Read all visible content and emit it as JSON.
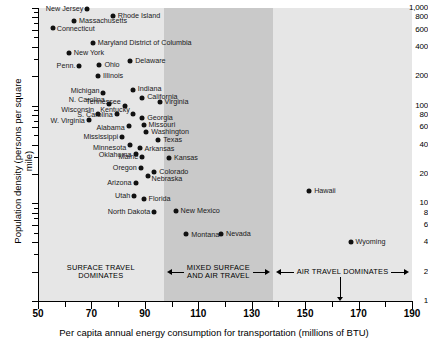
{
  "chart_data": {
    "type": "scatter",
    "title": "",
    "xlabel": "Per capita annual energy consumption for transportation (millions of BTU)",
    "ylabel": "Population density (persons per square mile)",
    "xscale": "linear",
    "yscale": "log",
    "xlim": [
      50,
      190
    ],
    "ylim": [
      1,
      1000
    ],
    "grid": false,
    "legend": "none",
    "xticks": [
      50,
      70,
      90,
      110,
      130,
      150,
      170,
      190
    ],
    "xticklabels": [
      "50",
      "70",
      "90",
      "110",
      "130",
      "150",
      "170",
      "190"
    ],
    "xminorticks": [
      60,
      80,
      100,
      120,
      140,
      160,
      180
    ],
    "yticks": [
      1,
      2,
      4,
      6,
      8,
      10,
      20,
      40,
      60,
      80,
      100,
      200,
      400,
      600,
      800,
      1000
    ],
    "yticklabels": [
      "1",
      "2",
      "4",
      "6",
      "8",
      "10",
      "20",
      "40",
      "60",
      "80",
      "100",
      "200",
      "400",
      "600",
      "800",
      "1,000"
    ],
    "points": [
      {
        "label": "New Jersey",
        "x": 68.5,
        "y": 980,
        "lpos": "l",
        "ldx": -4,
        "ldy": 0
      },
      {
        "label": "Rhode Island",
        "x": 78.0,
        "y": 830,
        "lpos": "r",
        "ldx": 5,
        "ldy": 0
      },
      {
        "label": "Massachusetts",
        "x": 63.5,
        "y": 730,
        "lpos": "r",
        "ldx": 5,
        "ldy": 0
      },
      {
        "label": "Connecticut",
        "x": 55.5,
        "y": 620,
        "lpos": "r",
        "ldx": 4,
        "ldy": 1
      },
      {
        "label": "Maryland District of Columbia",
        "x": 70.5,
        "y": 440,
        "lpos": "r",
        "ldx": 5,
        "ldy": 0
      },
      {
        "label": "New York",
        "x": 61.5,
        "y": 350,
        "lpos": "r",
        "ldx": 5,
        "ldy": 0
      },
      {
        "label": "Delaware",
        "x": 84.5,
        "y": 285,
        "lpos": "r",
        "ldx": 5,
        "ldy": 0
      },
      {
        "label": "Ohio",
        "x": 73.0,
        "y": 260,
        "lpos": "r",
        "ldx": 5,
        "ldy": 0
      },
      {
        "label": "Penn.",
        "x": 65.5,
        "y": 255,
        "lpos": "l",
        "ldx": -4,
        "ldy": 0
      },
      {
        "label": "Illinois",
        "x": 72.5,
        "y": 200,
        "lpos": "r",
        "ldx": 5,
        "ldy": 0
      },
      {
        "label": "Indiana",
        "x": 85.5,
        "y": 145,
        "lpos": "r",
        "ldx": 5,
        "ldy": -1
      },
      {
        "label": "Michigan",
        "x": 74.5,
        "y": 135,
        "lpos": "l",
        "ldx": -4,
        "ldy": -2
      },
      {
        "label": "California",
        "x": 89.0,
        "y": 120,
        "lpos": "r",
        "ldx": 5,
        "ldy": -1
      },
      {
        "label": "Virginia",
        "x": 95.5,
        "y": 108,
        "lpos": "r",
        "ldx": 5,
        "ldy": 0
      },
      {
        "label": "N. Carolina",
        "x": 76.5,
        "y": 103,
        "lpos": "l",
        "ldx": -4,
        "ldy": -4
      },
      {
        "label": "Tennessee",
        "x": 82.5,
        "y": 100,
        "lpos": "l",
        "ldx": -4,
        "ldy": -4
      },
      {
        "label": "Wisconsin",
        "x": 72.5,
        "y": 83,
        "lpos": "l",
        "ldx": -4,
        "ldy": -4
      },
      {
        "label": "Kentucky",
        "x": 85.5,
        "y": 83,
        "lpos": "l",
        "ldx": -3,
        "ldy": -4
      },
      {
        "label": "S. Carolina",
        "x": 79.5,
        "y": 82,
        "lpos": "l",
        "ldx": -4,
        "ldy": 1
      },
      {
        "label": "Georgia",
        "x": 89.0,
        "y": 75,
        "lpos": "r",
        "ldx": 5,
        "ldy": 0
      },
      {
        "label": "W. Virginia",
        "x": 69.0,
        "y": 71,
        "lpos": "l",
        "ldx": -4,
        "ldy": 1
      },
      {
        "label": "Missouri",
        "x": 89.5,
        "y": 64,
        "lpos": "r",
        "ldx": 5,
        "ldy": 0
      },
      {
        "label": "Alabama",
        "x": 84.0,
        "y": 62,
        "lpos": "l",
        "ldx": -4,
        "ldy": 2
      },
      {
        "label": "Washington",
        "x": 90.5,
        "y": 54,
        "lpos": "r",
        "ldx": 5,
        "ldy": 0
      },
      {
        "label": "Mississippi",
        "x": 81.5,
        "y": 48,
        "lpos": "l",
        "ldx": -4,
        "ldy": 0
      },
      {
        "label": "Texas",
        "x": 95.0,
        "y": 45,
        "lpos": "r",
        "ldx": 5,
        "ldy": 0
      },
      {
        "label": "Minnesota",
        "x": 84.5,
        "y": 40,
        "lpos": "l",
        "ldx": -4,
        "ldy": 3
      },
      {
        "label": "Arkansas",
        "x": 88.0,
        "y": 37,
        "lpos": "r",
        "ldx": 5,
        "ldy": 1
      },
      {
        "label": "Oklahoma",
        "x": 86.5,
        "y": 32,
        "lpos": "l",
        "ldx": -4,
        "ldy": 1
      },
      {
        "label": "Maine",
        "x": 89.0,
        "y": 30,
        "lpos": "l",
        "ldx": -4,
        "ldy": 0
      },
      {
        "label": "Kansas",
        "x": 99.0,
        "y": 29,
        "lpos": "r",
        "ldx": 5,
        "ldy": 0
      },
      {
        "label": "Oregon",
        "x": 88.5,
        "y": 23,
        "lpos": "l",
        "ldx": -4,
        "ldy": 0
      },
      {
        "label": "Colorado",
        "x": 93.5,
        "y": 21,
        "lpos": "r",
        "ldx": 5,
        "ldy": 0
      },
      {
        "label": "Nebraska",
        "x": 91.0,
        "y": 19,
        "lpos": "r",
        "ldx": 4,
        "ldy": 3
      },
      {
        "label": "Arizona",
        "x": 86.5,
        "y": 16,
        "lpos": "l",
        "ldx": -4,
        "ldy": 0
      },
      {
        "label": "Utah",
        "x": 86.0,
        "y": 12,
        "lpos": "l",
        "ldx": -4,
        "ldy": 0
      },
      {
        "label": "Florida",
        "x": 89.5,
        "y": 11,
        "lpos": "r",
        "ldx": 5,
        "ldy": 0
      },
      {
        "label": "North Dakota",
        "x": 93.5,
        "y": 8.2,
        "lpos": "l",
        "ldx": -4,
        "ldy": 0
      },
      {
        "label": "New Mexico",
        "x": 101.5,
        "y": 8.3,
        "lpos": "r",
        "ldx": 5,
        "ldy": 0
      },
      {
        "label": "Montana",
        "x": 105.5,
        "y": 4.9,
        "lpos": "r",
        "ldx": 5,
        "ldy": 1
      },
      {
        "label": "Nevada",
        "x": 118.5,
        "y": 4.8,
        "lpos": "r",
        "ldx": 5,
        "ldy": 0
      },
      {
        "label": "Hawaii",
        "x": 151.5,
        "y": 13.5,
        "lpos": "r",
        "ldx": 5,
        "ldy": 0
      },
      {
        "label": "Wyoming",
        "x": 167.0,
        "y": 4.0,
        "lpos": "r",
        "ldx": 5,
        "ldy": 0
      }
    ],
    "zones": [
      {
        "name": "surface",
        "label": "SURFACE TRAVEL DOMINATES",
        "x_start": 50,
        "x_end": 97,
        "shade": "#e6e6e6"
      },
      {
        "name": "mixed",
        "label": "MIXED SURFACE AND AIR TRAVEL",
        "x_start": 97,
        "x_end": 138,
        "shade": "#c9c9c9"
      },
      {
        "name": "air",
        "label": "AIR TRAVEL DOMINATES",
        "x_start": 138,
        "x_end": 190,
        "shade": "#e6e6e6"
      }
    ],
    "annotations": [
      {
        "label": "Alaska",
        "x": 163.0,
        "y_text": 2.2,
        "points_to_axis": true
      }
    ]
  }
}
